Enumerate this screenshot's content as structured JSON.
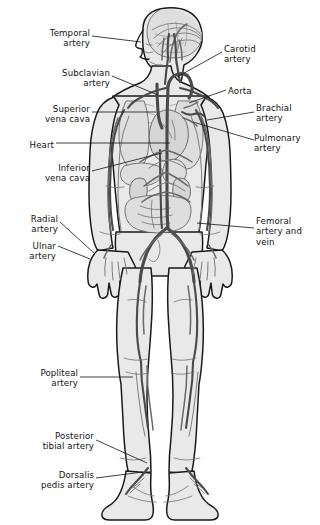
{
  "figure": {
    "background_color": "#ffffff",
    "ink_color": "#1a1a1a",
    "body_fill": "#e9e9e9",
    "organ_fill": "#d2d2d2",
    "vessel_dark": "#4a4a4a",
    "vessel_mid": "#6e6e6e",
    "vessel_light": "#9a9a9a",
    "leader_color": "#262626"
  },
  "labels": {
    "left": [
      {
        "id": "temporal-artery",
        "text": "Temporal\nartery",
        "x": 2,
        "y": 28,
        "w": 88
      },
      {
        "id": "subclavian-artery",
        "text": "Subclavian\nartery",
        "x": 2,
        "y": 68,
        "w": 108
      },
      {
        "id": "superior-vena-cava",
        "text": "Superior\nvena cava",
        "x": 2,
        "y": 104,
        "w": 88
      },
      {
        "id": "heart",
        "text": "Heart",
        "x": 2,
        "y": 140,
        "w": 88
      },
      {
        "id": "inferior-vena-cava",
        "text": "Inferior\nvena cava",
        "x": 2,
        "y": 163,
        "w": 88
      },
      {
        "id": "radial-artery",
        "text": "Radial\nartery",
        "x": 2,
        "y": 214,
        "w": 68
      },
      {
        "id": "ulnar-artery",
        "text": "Ulnar\nartery",
        "x": 2,
        "y": 241,
        "w": 68
      },
      {
        "id": "popliteal-artery",
        "text": "Popliteal\nartery",
        "x": 2,
        "y": 368,
        "w": 96
      },
      {
        "id": "posterior-tibial-artery",
        "text": "Posterior\ntibial artery",
        "x": 2,
        "y": 431,
        "w": 110
      },
      {
        "id": "dorsalis-pedis-artery",
        "text": "Dorsalis\npedis artery",
        "x": 2,
        "y": 470,
        "w": 110
      }
    ],
    "right": [
      {
        "id": "carotid-artery",
        "text": "Carotid\nartery",
        "x": 224,
        "y": 44,
        "w": 92
      },
      {
        "id": "aorta",
        "text": "Aorta",
        "x": 228,
        "y": 86,
        "w": 88
      },
      {
        "id": "brachial-artery",
        "text": "Brachial\nartery",
        "x": 256,
        "y": 103,
        "w": 62
      },
      {
        "id": "pulmonary-artery",
        "text": "Pulmonary\nartery",
        "x": 256,
        "y": 133,
        "w": 64
      },
      {
        "id": "femoral-artery-vein",
        "text": "Femoral\nartery and\nvein",
        "x": 256,
        "y": 216,
        "w": 64
      }
    ]
  },
  "leaders": {
    "description": "thin black pointer lines connecting each text label to its anatomical structure",
    "lines": [
      {
        "id": "leader-temporal-artery",
        "points": "92,36 140,42"
      },
      {
        "id": "leader-subclavian-artery",
        "points": "112,76 160,96"
      },
      {
        "id": "leader-superior-vena-cava",
        "points": "92,112 155,112"
      },
      {
        "id": "leader-heart",
        "points": "56,143 170,143"
      },
      {
        "id": "leader-inferior-vena-cava",
        "points": "92,171 163,154"
      },
      {
        "id": "leader-radial-artery",
        "points": "60,222 92,252"
      },
      {
        "id": "leader-ulnar-artery",
        "points": "58,246 88,258"
      },
      {
        "id": "leader-popliteal-artery",
        "points": "80,377 132,377"
      },
      {
        "id": "leader-posterior-tibial-artery",
        "points": "96,440 146,462"
      },
      {
        "id": "leader-dorsalis-pedis-artery",
        "points": "96,478 142,472"
      },
      {
        "id": "leader-carotid-artery",
        "points": "222,52 176,76"
      },
      {
        "id": "leader-aorta",
        "points": "226,90 188,104"
      },
      {
        "id": "leader-brachial-artery",
        "points": "254,112 206,120"
      },
      {
        "id": "leader-pulmonary-artery",
        "points": "254,140 192,122"
      },
      {
        "id": "leader-femoral-artery-vein",
        "points": "254,228 196,222"
      }
    ]
  },
  "anatomy": {
    "regions": [
      "head-profile",
      "brain-vasculature",
      "neck",
      "shoulders",
      "thorax",
      "heart",
      "lungs",
      "abdomen",
      "kidneys",
      "intestines",
      "pelvis",
      "arms",
      "hands",
      "thighs",
      "knees",
      "lower-legs",
      "feet"
    ],
    "vessels_shown": [
      "temporal artery",
      "carotid artery",
      "subclavian artery",
      "aorta",
      "superior vena cava",
      "inferior vena cava",
      "pulmonary artery",
      "brachial artery",
      "radial artery",
      "ulnar artery",
      "femoral artery and vein",
      "popliteal artery",
      "posterior tibial artery",
      "dorsalis pedis artery"
    ]
  }
}
